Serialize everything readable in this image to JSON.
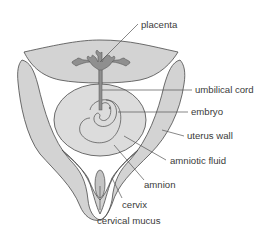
{
  "diagram": {
    "labels": {
      "placenta": "placenta",
      "umbilical_cord": "umbilical cord",
      "embryo": "embryo",
      "uterus_wall": "uterus wall",
      "amniotic_fluid": "amniotic fluid",
      "amnion": "amnion",
      "cervix": "cervix",
      "cervical_mucus": "cervical mucus"
    },
    "colors": {
      "tissue": "#d3d3d3",
      "placenta": "#8f8f8f",
      "outline": "#4a4a4a",
      "background": "#ffffff"
    }
  }
}
